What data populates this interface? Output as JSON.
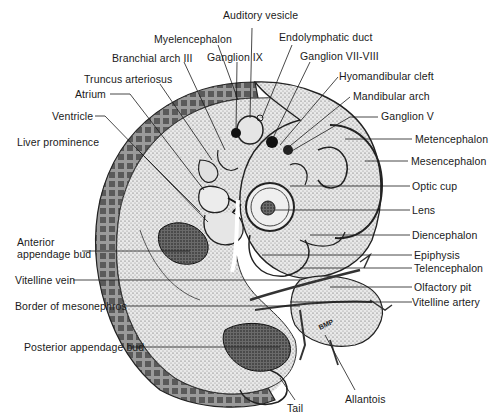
{
  "figure": {
    "initials": "BMP",
    "colors": {
      "ink": "#1a1a1a",
      "paper": "#ffffff",
      "shade_dark": "#2a2a2a",
      "shade_mid": "#8a8a8a",
      "shade_light": "#d8d8d8"
    }
  },
  "labels": {
    "auditory_vesicle": "Auditory vesicle",
    "myelencephalon": "Myelencephalon",
    "endolymphatic_duct": "Endolymphatic duct",
    "branchial_arch_iii": "Branchial arch III",
    "ganglion_ix": "Ganglion IX",
    "ganglion_vii_viii": "Ganglion VII-VIII",
    "truncus_arteriosus": "Truncus arteriosus",
    "hyomandibular_cleft": "Hyomandibular cleft",
    "atrium": "Atrium",
    "mandibular_arch": "Mandibular arch",
    "ganglion_v": "Ganglion V",
    "ventricle": "Ventricle",
    "metencephalon": "Metencephalon",
    "liver_prominence": "Liver prominence",
    "mesencephalon": "Mesencephalon",
    "optic_cup": "Optic cup",
    "lens": "Lens",
    "anterior_appendage_bud": "Anterior\nappendage bud",
    "diencephalon": "Diencephalon",
    "epiphysis": "Epiphysis",
    "vitelline_vein": "Vitelline vein",
    "telencephalon": "Telencephalon",
    "olfactory_pit": "Olfactory pit",
    "border_of_mesonephros": "Border of mesonephros",
    "vitelline_artery": "Vitelline artery",
    "posterior_appendage_bud": "Posterior appendage bud",
    "allantois": "Allantois",
    "tail": "Tail"
  }
}
